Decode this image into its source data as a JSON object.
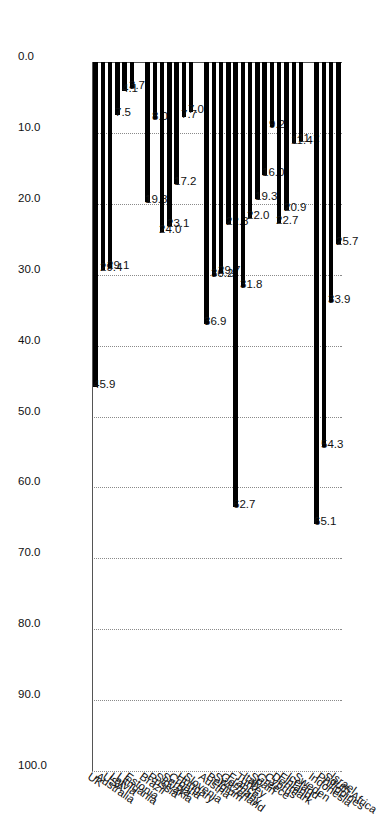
{
  "chart_data": {
    "type": "bar",
    "orientation": "vertical",
    "title": "",
    "subtitle": "",
    "xlabel": "",
    "ylabel": "",
    "ylim": [
      0.0,
      100.0
    ],
    "ytick_labels": [
      "0.0",
      "10.0",
      "20.0",
      "30.0",
      "40.0",
      "50.0",
      "60.0",
      "70.0",
      "80.0",
      "90.0",
      "100.0"
    ],
    "ytick_values": [
      0.0,
      10.0,
      20.0,
      30.0,
      40.0,
      50.0,
      60.0,
      70.0,
      80.0,
      90.0,
      100.0
    ],
    "grid": true,
    "grid_axis": "y",
    "grid_style": "dotted",
    "legend": false,
    "legend_position": "none",
    "bar_color": "#000000",
    "data_labels": true,
    "categories": [
      "UK",
      "Australia",
      "USA",
      "Latvia",
      "Lithuania",
      "Estonia",
      "Brazil",
      "Russia",
      "Slovakia",
      "Serbia",
      "Croatia",
      "Hungary",
      "Slovenia",
      "Austria",
      "Belgium",
      "Switzerland",
      "Germany",
      "France",
      "Turkey",
      "Italy",
      "Spain",
      "Greece",
      "Cyprus",
      "Denmark",
      "Finland",
      "Iceland",
      "Sweden",
      "Indonesia",
      "Philippines",
      "South Africa",
      "Israel"
    ],
    "values": [
      45.9,
      29.4,
      29.1,
      7.5,
      4.1,
      3.7,
      19.8,
      8.0,
      24.0,
      23.1,
      17.2,
      7.7,
      7.0,
      36.9,
      30.2,
      29.7,
      22.8,
      62.7,
      31.8,
      22.0,
      19.3,
      16.0,
      9.2,
      22.7,
      20.9,
      11.4,
      11.2,
      65.1,
      54.3,
      33.9,
      25.7
    ],
    "value_labels": [
      "45.9",
      "29.4",
      "29.1",
      "7.5",
      "4.1",
      "3.7",
      "19.8",
      "8.0",
      "24.0",
      "23.1",
      "17.2",
      "7.7",
      "7.0",
      "36.9",
      "30.2",
      "29.7",
      "22.8",
      "62.7",
      "31.8",
      "22.0",
      "19.3",
      "16.0",
      "9.2",
      "22.7",
      "20.9",
      "11.4",
      "11.2",
      "65.1",
      "54.3",
      "33.9",
      "25.7"
    ],
    "group_gaps_after": [
      "Estonia",
      "Slovenia",
      "Sweden"
    ],
    "axis_color": "#555555",
    "grid_color": "#8a8a8a",
    "text_color": "#111111",
    "background": "#ffffff"
  }
}
